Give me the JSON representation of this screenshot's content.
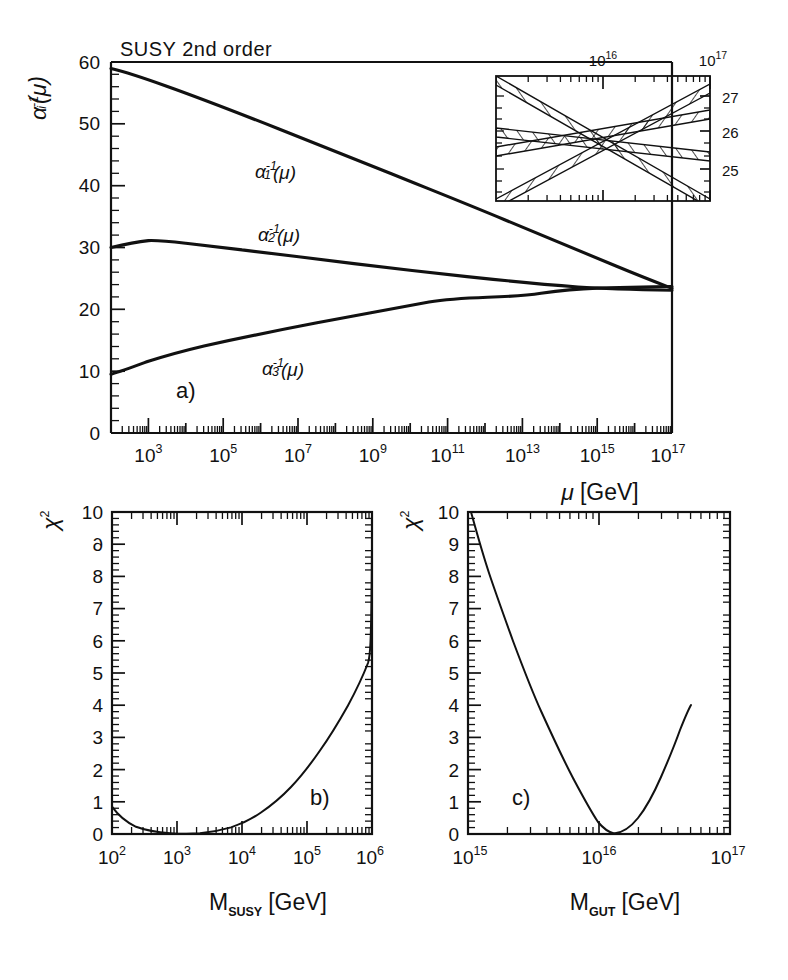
{
  "figure": {
    "caption_panels": [
      "a)",
      "b)",
      "c)"
    ],
    "background": "#ffffff",
    "ink": "#111111"
  },
  "panel_a": {
    "title": "SUSY 2nd order",
    "panel_label": "a)",
    "ylabel": "α",
    "ylabel_sub": "i",
    "ylabel_sup": "-1",
    "ylabel_arg": "(μ)",
    "xlabel_main": "μ",
    "xlabel_unit": "[GeV]",
    "y_ticks": [
      "0",
      "10",
      "20",
      "30",
      "40",
      "50",
      "60"
    ],
    "y_tick_values": [
      0,
      10,
      20,
      30,
      40,
      50,
      60
    ],
    "x_tick_labels": [
      "10",
      "10",
      "10",
      "10",
      "10",
      "10",
      "10",
      "10"
    ],
    "x_tick_exponents": [
      "3",
      "5",
      "7",
      "9",
      "11",
      "13",
      "15",
      "17"
    ],
    "x_tick_decades": [
      3,
      5,
      7,
      9,
      11,
      13,
      15,
      17
    ],
    "curve_labels": [
      {
        "base": "α",
        "sub": "1",
        "sup": "-1",
        "arg": "(μ)"
      },
      {
        "base": "α",
        "sub": "2",
        "sup": "-1",
        "arg": "(μ)"
      },
      {
        "base": "α",
        "sub": "3",
        "sup": "-1",
        "arg": "(μ)"
      }
    ]
  },
  "inset": {
    "x_tick_labels": [
      "10",
      "10"
    ],
    "x_tick_exponents": [
      "16",
      "17"
    ],
    "y_tick_labels": [
      "25",
      "26",
      "27"
    ],
    "y_tick_values": [
      25,
      26,
      27
    ],
    "band_count": 3
  },
  "panel_b": {
    "panel_label": "b)",
    "ylabel": "χ",
    "ylabel_sup": "2",
    "xlabel_main": "M",
    "xlabel_sub": "SUSY",
    "xlabel_unit": "[GeV]",
    "y_ticks": [
      "0",
      "1",
      "2",
      "3",
      "4",
      "5",
      "6",
      "7",
      "8",
      "9",
      "10"
    ],
    "y_tick_values": [
      0,
      1,
      2,
      3,
      4,
      5,
      6,
      7,
      8,
      9,
      10
    ],
    "x_tick_labels": [
      "10",
      "10",
      "10",
      "10",
      "10"
    ],
    "x_tick_exponents": [
      "2",
      "3",
      "4",
      "5",
      "6"
    ],
    "x_tick_decades": [
      2,
      3,
      4,
      5,
      6
    ]
  },
  "panel_c": {
    "panel_label": "c)",
    "ylabel": "χ",
    "ylabel_sup": "2",
    "xlabel_main": "M",
    "xlabel_sub": "GUT",
    "xlabel_unit": "[GeV]",
    "y_ticks": [
      "0",
      "1",
      "2",
      "3",
      "4",
      "5",
      "6",
      "7",
      "8",
      "9",
      "10"
    ],
    "y_tick_values": [
      0,
      1,
      2,
      3,
      4,
      5,
      6,
      7,
      8,
      9,
      10
    ],
    "x_tick_labels": [
      "10",
      "10",
      "10"
    ],
    "x_tick_exponents": [
      "15",
      "16",
      "17"
    ],
    "x_tick_decades": [
      15,
      16,
      17
    ]
  },
  "chart_data": [
    {
      "type": "line",
      "id": "panel_a",
      "title": "SUSY 2nd order",
      "xlabel": "μ [GeV]",
      "ylabel": "α_i^-1(μ)",
      "xscale": "log",
      "xlim": [
        100,
        1e+17
      ],
      "ylim": [
        0,
        60
      ],
      "grid": false,
      "legend": "inline-labels",
      "series": [
        {
          "name": "α_1^-1(μ)",
          "x": [
            100.0,
            1000.0,
            10000.0,
            100000.0,
            1000000.0,
            10000000.0,
            100000000.0,
            1000000000.0,
            10000000000.0,
            100000000000.0,
            1000000000000.0,
            10000000000000.0,
            100000000000000.0,
            1000000000000000.0,
            1e+16,
            3e+16,
            1e+17
          ],
          "y": [
            59.0,
            57.3,
            55.0,
            52.6,
            50.2,
            47.8,
            45.3,
            42.8,
            40.3,
            37.8,
            35.3,
            32.8,
            30.3,
            27.8,
            25.9,
            25.0,
            23.4
          ]
        },
        {
          "name": "α_2^-1(μ)",
          "x": [
            100.0,
            1000.0,
            10000.0,
            100000.0,
            1000000.0,
            10000000.0,
            100000000.0,
            1000000000.0,
            10000000000.0,
            100000000000.0,
            1000000000000.0,
            10000000000000.0,
            100000000000000.0,
            1000000000000000.0,
            1e+16,
            3e+16,
            1e+17
          ],
          "y": [
            30.0,
            31.1,
            30.7,
            30.2,
            29.8,
            29.4,
            29.0,
            28.6,
            28.2,
            27.8,
            27.4,
            27.0,
            26.6,
            26.2,
            25.9,
            25.7,
            25.5
          ]
        },
        {
          "name": "α_3^-1(μ)",
          "x": [
            100.0,
            1000.0,
            10000.0,
            100000.0,
            1000000.0,
            10000000.0,
            100000000.0,
            1000000000.0,
            10000000000.0,
            100000000000.0,
            1000000000000.0,
            10000000000000.0,
            100000000000000.0,
            1000000000000000.0,
            1e+16,
            3e+16,
            1e+17
          ],
          "y": [
            9.5,
            11.6,
            13.0,
            14.2,
            15.4,
            16.5,
            17.6,
            18.7,
            19.8,
            20.9,
            22.0,
            23.1,
            24.1,
            25.1,
            25.9,
            26.2,
            26.6
          ]
        }
      ]
    },
    {
      "type": "line",
      "id": "inset",
      "xlabel": "μ [GeV]",
      "ylabel": "α_i^-1(μ)",
      "xscale": "log",
      "xlim": [
        3160000000000000.0,
        1e+17
      ],
      "ylim": [
        24.4,
        27.6
      ],
      "grid": false,
      "note": "three hatched error bands crossing near 10^16",
      "series": [
        {
          "name": "band_1_rising_steep",
          "slope": "rising",
          "x": [
            3160000000000000.0,
            1e+17
          ],
          "y": [
            24.6,
            27.6
          ],
          "halfwidth": 0.17
        },
        {
          "name": "band_2_rising_shallow",
          "slope": "rising",
          "x": [
            3160000000000000.0,
            1e+17
          ],
          "y": [
            25.4,
            26.6
          ],
          "halfwidth": 0.14
        },
        {
          "name": "band_3_falling",
          "slope": "falling",
          "x": [
            3160000000000000.0,
            1e+17
          ],
          "y": [
            27.6,
            24.4
          ],
          "halfwidth": 0.17
        },
        {
          "name": "band_4_falling_shallow",
          "slope": "falling",
          "x": [
            3160000000000000.0,
            1e+17
          ],
          "y": [
            26.2,
            25.3
          ],
          "halfwidth": 0.13
        }
      ]
    },
    {
      "type": "line",
      "id": "panel_b",
      "xlabel": "M_SUSY [GeV]",
      "ylabel": "χ²",
      "xscale": "log",
      "xlim": [
        100.0,
        1000000.0
      ],
      "ylim": [
        0,
        10
      ],
      "grid": false,
      "x": [
        100.0,
        200.0,
        300.0,
        500.0,
        700.0,
        1000.0,
        2000.0,
        3000.0,
        5000.0,
        10000.0,
        20000.0,
        50000.0,
        100000.0,
        200000.0,
        400000.0,
        700000.0,
        1000000.0
      ],
      "y": [
        0.85,
        0.42,
        0.22,
        0.06,
        0.02,
        0.01,
        0.08,
        0.22,
        0.55,
        1.25,
        2.05,
        3.35,
        4.35,
        5.55,
        6.85,
        8.0,
        8.6
      ]
    },
    {
      "type": "line",
      "id": "panel_c",
      "xlabel": "M_GUT [GeV]",
      "ylabel": "χ²",
      "xscale": "log",
      "xlim": [
        1000000000000000.0,
        1e+17
      ],
      "ylim": [
        0,
        10
      ],
      "grid": false,
      "x": [
        1020000000000000.0,
        1200000000000000.0,
        1500000000000000.0,
        2000000000000000.0,
        2600000000000000.0,
        3300000000000000.0,
        4300000000000000.0,
        5600000000000000.0,
        7000000000000000.0,
        8500000000000000.0,
        1e+16,
        1.2e+16,
        1.5e+16,
        2e+16,
        2.6e+16
      ],
      "y": [
        10.0,
        8.6,
        6.9,
        5.1,
        3.7,
        2.6,
        1.6,
        0.75,
        0.2,
        0.03,
        0.02,
        0.2,
        0.55,
        1.25,
        2.0
      ]
    }
  ]
}
